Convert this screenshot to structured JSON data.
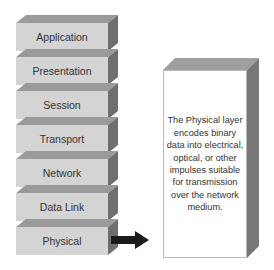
{
  "diagram": {
    "layers": [
      {
        "label": "Application"
      },
      {
        "label": "Presentation"
      },
      {
        "label": "Session"
      },
      {
        "label": "Transport"
      },
      {
        "label": "Network"
      },
      {
        "label": "Data Link"
      },
      {
        "label": "Physical"
      }
    ],
    "arrow": {
      "from": "Physical",
      "to": "description-box",
      "color": "#1a1a1a"
    },
    "description": "The Physical layer encodes binary data into electrical, optical, or other impulses suitable for transmission over the network medium.",
    "colors": {
      "layer_front": "#d4d4d4",
      "layer_top": "#9a9a9a",
      "layer_side": "#6f6f6f",
      "box_front": "#ffffff",
      "box_side": "#777777"
    }
  }
}
